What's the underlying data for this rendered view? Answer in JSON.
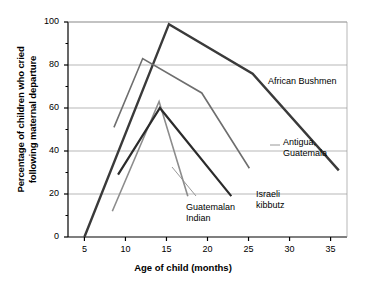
{
  "chart_data": {
    "type": "line",
    "title": "",
    "xlabel": "Age of child (months)",
    "ylabel": "Percentage of children who cried\nfollowing maternal departure",
    "ylabel_line1": "Percentage of children who cried",
    "ylabel_line2": "following maternal departure",
    "xlim": [
      3,
      37
    ],
    "ylim": [
      0,
      100
    ],
    "xticks": [
      5,
      10,
      15,
      20,
      25,
      30,
      35
    ],
    "yticks": [
      0,
      20,
      40,
      60,
      80,
      100
    ],
    "yminorticks": [
      10,
      30,
      50,
      70,
      90
    ],
    "grid": "horizontal",
    "legend_position": "inline-annotations",
    "series": [
      {
        "name": "African Bushmen",
        "color": "#3a3a3a",
        "width": 2.4,
        "label_x": 268,
        "label_y": 76,
        "points": [
          {
            "x": 5,
            "y": 0
          },
          {
            "x": 15.3,
            "y": 99
          },
          {
            "x": 25.5,
            "y": 76
          },
          {
            "x": 36,
            "y": 31
          }
        ]
      },
      {
        "name": "Antigua,\nGuatemala",
        "label_line1": "Antigua,",
        "label_line2": "Guatemala",
        "color": "#6e6e6e",
        "width": 1.6,
        "label_x": 283,
        "label_y": 137,
        "points": [
          {
            "x": 8.6,
            "y": 51
          },
          {
            "x": 12.1,
            "y": 83
          },
          {
            "x": 19.3,
            "y": 67
          },
          {
            "x": 25.1,
            "y": 32
          }
        ]
      },
      {
        "name": "Guatemalan\nIndian",
        "label_line1": "Guatemalan",
        "label_line2": "Indian",
        "color": "#8c8c8c",
        "width": 1.6,
        "label_x": 186,
        "label_y": 202,
        "points": [
          {
            "x": 8.4,
            "y": 12
          },
          {
            "x": 14.1,
            "y": 63
          },
          {
            "x": 17.6,
            "y": 19
          }
        ]
      },
      {
        "name": "Israeli\nkibbutz",
        "label_line1": "Israeli",
        "label_line2": "kibbutz",
        "color": "#2b2b2b",
        "width": 2.2,
        "label_x": 256,
        "label_y": 189,
        "points": [
          {
            "x": 9.1,
            "y": 29
          },
          {
            "x": 14.2,
            "y": 60
          },
          {
            "x": 22.9,
            "y": 19
          }
        ]
      }
    ],
    "annotation_leaders": [
      {
        "name": "guatemalan-indian-leader",
        "x1": 172,
        "y1": 167,
        "x2": 196,
        "y2": 196
      },
      {
        "name": "antigua-guatemala-leader",
        "x1": 270,
        "y1": 145,
        "x2": 280,
        "y2": 145
      }
    ]
  }
}
